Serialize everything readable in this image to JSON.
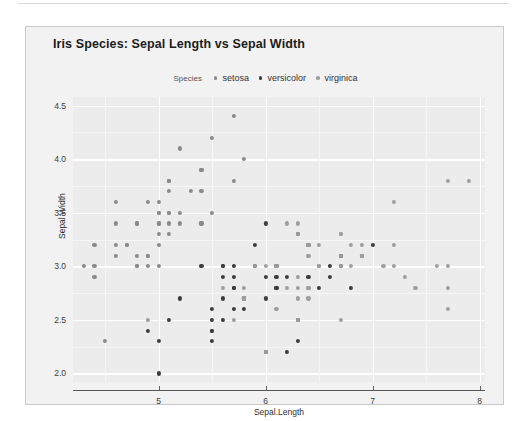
{
  "chart_data": {
    "type": "scatter",
    "title": "Iris Species: Sepal Length vs Sepal Width",
    "xlabel": "Sepal.Length",
    "ylabel": "Sepal Width",
    "xlim": [
      4.2,
      8.05
    ],
    "ylim": [
      1.92,
      4.58
    ],
    "xticks": [
      "5",
      "6",
      "7",
      "8"
    ],
    "xtick_values": [
      5,
      6,
      7,
      8
    ],
    "yticks": [
      "2.0",
      "2.5",
      "3.0",
      "3.5",
      "4.0",
      "4.5"
    ],
    "ytick_values": [
      2.0,
      2.5,
      3.0,
      3.5,
      4.0,
      4.5
    ],
    "grid": true,
    "legend_position": "top",
    "legend_title": "Species",
    "panel_color": "#ececec",
    "gridline_color": "#ffffff",
    "series": [
      {
        "name": "setosa",
        "color": "#8a8a8a",
        "points": [
          [
            5.1,
            3.5
          ],
          [
            4.9,
            3.0
          ],
          [
            4.7,
            3.2
          ],
          [
            4.6,
            3.1
          ],
          [
            5.0,
            3.6
          ],
          [
            5.4,
            3.9
          ],
          [
            4.6,
            3.4
          ],
          [
            5.0,
            3.4
          ],
          [
            4.4,
            2.9
          ],
          [
            4.9,
            3.1
          ],
          [
            5.4,
            3.7
          ],
          [
            4.8,
            3.4
          ],
          [
            4.8,
            3.0
          ],
          [
            4.3,
            3.0
          ],
          [
            5.8,
            4.0
          ],
          [
            5.7,
            4.4
          ],
          [
            5.4,
            3.9
          ],
          [
            5.1,
            3.5
          ],
          [
            5.7,
            3.8
          ],
          [
            5.1,
            3.8
          ],
          [
            5.4,
            3.4
          ],
          [
            5.1,
            3.7
          ],
          [
            4.6,
            3.6
          ],
          [
            5.1,
            3.3
          ],
          [
            4.8,
            3.4
          ],
          [
            5.0,
            3.0
          ],
          [
            5.0,
            3.4
          ],
          [
            5.2,
            3.5
          ],
          [
            5.2,
            3.4
          ],
          [
            4.7,
            3.2
          ],
          [
            4.8,
            3.1
          ],
          [
            5.4,
            3.4
          ],
          [
            5.2,
            4.1
          ],
          [
            5.5,
            4.2
          ],
          [
            4.9,
            3.1
          ],
          [
            5.0,
            3.2
          ],
          [
            5.5,
            3.5
          ],
          [
            4.9,
            3.6
          ],
          [
            4.4,
            3.0
          ],
          [
            5.1,
            3.4
          ],
          [
            5.0,
            3.5
          ],
          [
            4.5,
            2.3
          ],
          [
            4.4,
            3.2
          ],
          [
            5.0,
            3.5
          ],
          [
            5.1,
            3.8
          ],
          [
            4.8,
            3.0
          ],
          [
            5.1,
            3.8
          ],
          [
            4.6,
            3.2
          ],
          [
            5.3,
            3.7
          ],
          [
            5.0,
            3.3
          ]
        ]
      },
      {
        "name": "versicolor",
        "color": "#3c3c3c",
        "points": [
          [
            7.0,
            3.2
          ],
          [
            6.4,
            3.2
          ],
          [
            6.9,
            3.1
          ],
          [
            5.5,
            2.3
          ],
          [
            6.5,
            2.8
          ],
          [
            5.7,
            2.8
          ],
          [
            6.3,
            3.3
          ],
          [
            4.9,
            2.4
          ],
          [
            6.6,
            2.9
          ],
          [
            5.2,
            2.7
          ],
          [
            5.0,
            2.0
          ],
          [
            5.9,
            3.0
          ],
          [
            6.0,
            2.2
          ],
          [
            6.1,
            2.9
          ],
          [
            5.6,
            2.9
          ],
          [
            6.7,
            3.1
          ],
          [
            5.6,
            3.0
          ],
          [
            5.8,
            2.7
          ],
          [
            6.2,
            2.2
          ],
          [
            5.6,
            2.5
          ],
          [
            5.9,
            3.2
          ],
          [
            6.1,
            2.8
          ],
          [
            6.3,
            2.5
          ],
          [
            6.1,
            2.8
          ],
          [
            6.4,
            2.9
          ],
          [
            6.6,
            3.0
          ],
          [
            6.8,
            2.8
          ],
          [
            6.7,
            3.0
          ],
          [
            6.0,
            2.9
          ],
          [
            5.7,
            2.6
          ],
          [
            5.5,
            2.4
          ],
          [
            5.5,
            2.4
          ],
          [
            5.8,
            2.7
          ],
          [
            6.0,
            2.7
          ],
          [
            5.4,
            3.0
          ],
          [
            6.0,
            3.4
          ],
          [
            6.7,
            3.1
          ],
          [
            6.3,
            2.3
          ],
          [
            5.6,
            3.0
          ],
          [
            5.5,
            2.5
          ],
          [
            5.5,
            2.6
          ],
          [
            6.1,
            3.0
          ],
          [
            5.8,
            2.6
          ],
          [
            5.0,
            2.3
          ],
          [
            5.6,
            2.7
          ],
          [
            5.7,
            3.0
          ],
          [
            5.7,
            2.9
          ],
          [
            6.2,
            2.9
          ],
          [
            5.1,
            2.5
          ],
          [
            5.7,
            2.8
          ]
        ]
      },
      {
        "name": "virginica",
        "color": "#9e9e9e",
        "points": [
          [
            6.3,
            3.3
          ],
          [
            5.8,
            2.7
          ],
          [
            7.1,
            3.0
          ],
          [
            6.3,
            2.9
          ],
          [
            6.5,
            3.0
          ],
          [
            7.6,
            3.0
          ],
          [
            4.9,
            2.5
          ],
          [
            7.3,
            2.9
          ],
          [
            6.7,
            2.5
          ],
          [
            7.2,
            3.6
          ],
          [
            6.5,
            3.2
          ],
          [
            6.4,
            2.7
          ],
          [
            6.8,
            3.0
          ],
          [
            5.7,
            2.5
          ],
          [
            5.8,
            2.8
          ],
          [
            6.4,
            3.2
          ],
          [
            6.5,
            3.0
          ],
          [
            7.7,
            3.8
          ],
          [
            7.7,
            2.6
          ],
          [
            6.0,
            2.2
          ],
          [
            6.9,
            3.2
          ],
          [
            5.6,
            2.8
          ],
          [
            7.7,
            2.8
          ],
          [
            6.3,
            2.7
          ],
          [
            6.7,
            3.3
          ],
          [
            7.2,
            3.2
          ],
          [
            6.2,
            2.8
          ],
          [
            6.1,
            3.0
          ],
          [
            6.4,
            2.8
          ],
          [
            7.2,
            3.0
          ],
          [
            7.4,
            2.8
          ],
          [
            7.9,
            3.8
          ],
          [
            6.4,
            2.8
          ],
          [
            6.3,
            2.8
          ],
          [
            6.1,
            2.6
          ],
          [
            7.7,
            3.0
          ],
          [
            6.3,
            3.4
          ],
          [
            6.4,
            3.1
          ],
          [
            6.0,
            3.0
          ],
          [
            6.9,
            3.1
          ],
          [
            6.7,
            3.1
          ],
          [
            6.9,
            3.1
          ],
          [
            5.8,
            2.7
          ],
          [
            6.8,
            3.2
          ],
          [
            6.7,
            3.3
          ],
          [
            6.7,
            3.0
          ],
          [
            6.3,
            2.5
          ],
          [
            6.5,
            3.0
          ],
          [
            6.2,
            3.4
          ],
          [
            5.9,
            3.0
          ]
        ]
      }
    ]
  }
}
